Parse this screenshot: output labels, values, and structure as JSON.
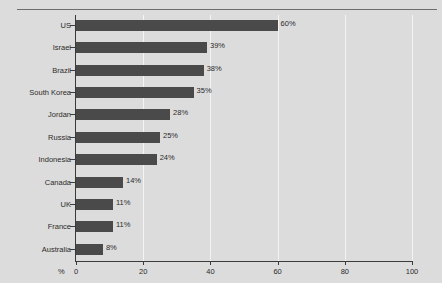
{
  "chart_data": {
    "type": "bar",
    "orientation": "horizontal",
    "title": "",
    "xlabel": "%",
    "ylabel": "",
    "xlim": [
      0,
      100
    ],
    "grid": true,
    "legend": null,
    "categories": [
      "US",
      "Israel",
      "Brazil",
      "South Korea",
      "Jordan",
      "Russia",
      "Indonesia",
      "Canada",
      "UK",
      "France",
      "Australia"
    ],
    "values": [
      60,
      39,
      38,
      35,
      28,
      25,
      24,
      14,
      11,
      11,
      8
    ],
    "data_labels": [
      "60%",
      "39%",
      "38%",
      "35%",
      "28%",
      "25%",
      "24%",
      "14%",
      "11%",
      "11%",
      "8%"
    ],
    "xticks": [
      0,
      20,
      40,
      60,
      80,
      100
    ],
    "xtick_labels": [
      "0",
      "20",
      "40",
      "60",
      "80",
      "100"
    ],
    "bar_color": "#4a4a4a",
    "background_color": "#dcdcdc",
    "gridline_color": "#f4f4f4",
    "axis_color": "#3a3a3a"
  },
  "figure": {
    "axis_unit_label": "%",
    "title_text": ""
  }
}
